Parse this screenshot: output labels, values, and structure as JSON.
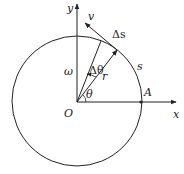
{
  "diagram": {
    "type": "circular-motion",
    "labels": {
      "y_axis": "y",
      "x_axis": "x",
      "origin": "O",
      "point_a": "A",
      "velocity": "v",
      "arc_increment": "Δs",
      "arc": "s",
      "radius": "r",
      "angular_velocity": "ω",
      "angle": "θ",
      "angle_increment": "Δθ"
    },
    "colors": {
      "stroke": "#222222",
      "background": "#ffffff"
    }
  }
}
